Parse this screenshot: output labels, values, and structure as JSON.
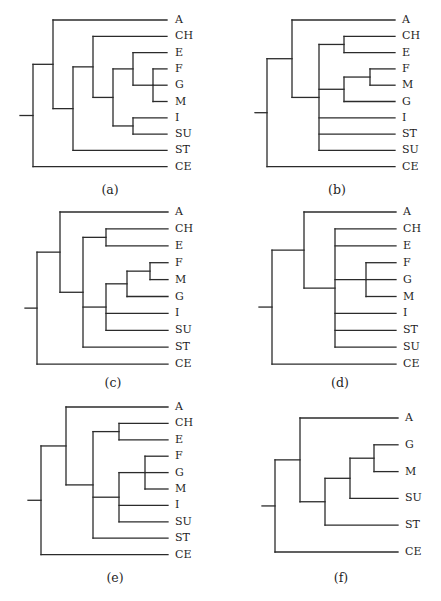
{
  "figure": {
    "panels": [
      {
        "id": "a",
        "caption": "(a)",
        "tree": {
          "children": [
            {
              "children": [
                "A",
                {
                  "children": [
                    {
                      "children": [
                        "CH",
                        {
                          "children": [
                            {
                              "children": [
                                "E",
                                {
                                  "children": [
                                    "F",
                                    "G",
                                    "M"
                                  ]
                                }
                              ]
                            },
                            {
                              "children": [
                                "I",
                                "SU"
                              ]
                            }
                          ]
                        }
                      ]
                    },
                    "ST"
                  ]
                }
              ]
            },
            "CE"
          ]
        },
        "leaf_order": [
          "A",
          "CH",
          "E",
          "F",
          "G",
          "M",
          "I",
          "SU",
          "ST",
          "CE"
        ]
      },
      {
        "id": "b",
        "caption": "(b)",
        "tree": {
          "children": [
            {
              "children": [
                "A",
                {
                  "children": [
                    {
                      "children": [
                        "CH",
                        "E"
                      ]
                    },
                    {
                      "children": [
                        {
                          "children": [
                            "F",
                            "M"
                          ]
                        },
                        "G"
                      ]
                    },
                    "I",
                    "ST",
                    "SU"
                  ]
                }
              ]
            },
            "CE"
          ]
        },
        "leaf_order": [
          "A",
          "CH",
          "E",
          "F",
          "M",
          "G",
          "I",
          "ST",
          "SU",
          "CE"
        ]
      },
      {
        "id": "c",
        "caption": "(c)",
        "tree": {
          "children": [
            {
              "children": [
                "A",
                {
                  "children": [
                    {
                      "children": [
                        "CH",
                        "E"
                      ]
                    },
                    {
                      "children": [
                        {
                          "children": [
                            {
                              "children": [
                                "F",
                                "M"
                              ]
                            },
                            "G"
                          ]
                        },
                        "I",
                        "SU"
                      ]
                    },
                    "ST"
                  ]
                }
              ]
            },
            "CE"
          ]
        },
        "leaf_order": [
          "A",
          "CH",
          "E",
          "F",
          "M",
          "G",
          "I",
          "SU",
          "ST",
          "CE"
        ]
      },
      {
        "id": "d",
        "caption": "(d)",
        "tree": {
          "children": [
            {
              "children": [
                "A",
                {
                  "children": [
                    "CH",
                    "E",
                    {
                      "children": [
                        "F",
                        "G",
                        "M"
                      ]
                    },
                    "I",
                    "ST",
                    "SU"
                  ]
                }
              ]
            },
            "CE"
          ]
        },
        "leaf_order": [
          "A",
          "CH",
          "E",
          "F",
          "G",
          "M",
          "I",
          "ST",
          "SU",
          "CE"
        ]
      },
      {
        "id": "e",
        "caption": "(e)",
        "tree": {
          "children": [
            {
              "children": [
                "A",
                {
                  "children": [
                    {
                      "children": [
                        "CH",
                        "E"
                      ]
                    },
                    {
                      "children": [
                        {
                          "children": [
                            "F",
                            "G",
                            "M"
                          ]
                        },
                        "I",
                        "SU"
                      ]
                    },
                    "ST"
                  ]
                }
              ]
            },
            "CE"
          ]
        },
        "leaf_order": [
          "A",
          "CH",
          "E",
          "F",
          "G",
          "M",
          "I",
          "SU",
          "ST",
          "CE"
        ]
      },
      {
        "id": "f",
        "caption": "(f)",
        "tree": {
          "children": [
            {
              "children": [
                "A",
                {
                  "children": [
                    {
                      "children": [
                        {
                          "children": [
                            "G",
                            "M"
                          ]
                        },
                        "SU"
                      ]
                    },
                    "ST"
                  ]
                }
              ]
            },
            "CE"
          ]
        },
        "leaf_order": [
          "A",
          "G",
          "M",
          "SU",
          "ST",
          "CE"
        ],
        "highlight": {
          "leaf": "CE",
          "color": "#2e318c"
        }
      }
    ],
    "branch_color": "#2b2b2b"
  }
}
